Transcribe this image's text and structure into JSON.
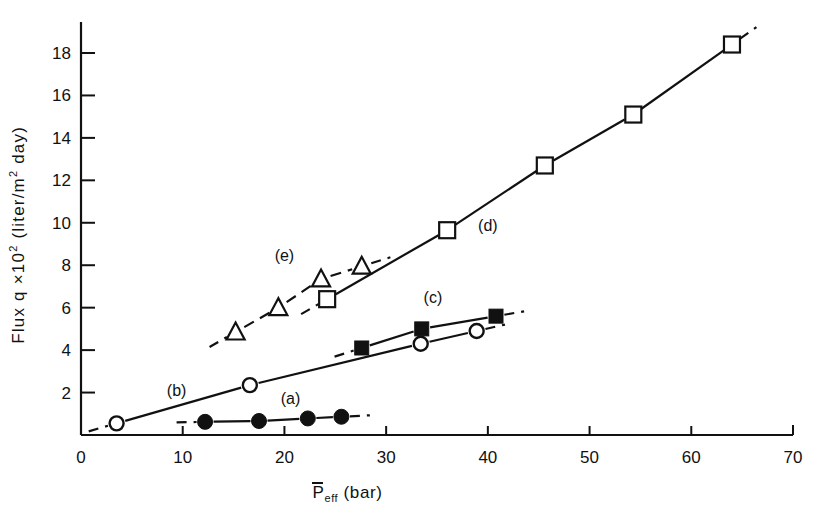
{
  "figure": {
    "background": "#ffffff",
    "ink_color": "#111111"
  },
  "chart_data": {
    "type": "scatter",
    "title": "",
    "subtitle": "",
    "xlabel": "P̄eff (bar)",
    "xlabel_parts": {
      "bar_letter": "P",
      "subscript": "eff",
      "unit": "(bar)"
    },
    "ylabel": "Flux q ×10² (liter/m² day)",
    "ylabel_parts": {
      "prefix": "Flux q ×10",
      "exponent": "2",
      "unit": "(liter/m",
      "unit_exponent": "2",
      "unit_tail": " day)"
    },
    "xlim": [
      0,
      70
    ],
    "ylim": [
      0,
      19.4
    ],
    "xticks": [
      0,
      10,
      20,
      30,
      40,
      50,
      60,
      70
    ],
    "xticklabels": [
      "0",
      "10",
      "20",
      "30",
      "40",
      "50",
      "60",
      "70"
    ],
    "yticks": [
      2,
      4,
      6,
      8,
      10,
      12,
      14,
      16,
      18
    ],
    "yticklabels": [
      "2",
      "4",
      "6",
      "8",
      "10",
      "12",
      "14",
      "16",
      "18"
    ],
    "grid": false,
    "legend_position": "inline-annotations",
    "series": [
      {
        "name": "(a)",
        "label": "(a)",
        "marker": "filled-circle",
        "line": "solid",
        "dashed_extensions": true,
        "label_x": 20.6,
        "label_y": 1.45,
        "x": [
          12.2,
          17.5,
          22.3,
          25.6
        ],
        "y": [
          0.62,
          0.66,
          0.78,
          0.86
        ]
      },
      {
        "name": "(b)",
        "label": "(b)",
        "marker": "open-circle",
        "line": "solid",
        "dashed_extensions": true,
        "label_x": 9.4,
        "label_y": 1.85,
        "x": [
          3.5,
          16.6,
          33.4,
          38.9
        ],
        "y": [
          0.55,
          2.35,
          4.3,
          4.9
        ]
      },
      {
        "name": "(c)",
        "label": "(c)",
        "marker": "filled-square",
        "line": "solid",
        "dashed_extensions": true,
        "label_x": 34.6,
        "label_y": 6.2,
        "x": [
          27.6,
          33.5,
          40.8
        ],
        "y": [
          4.1,
          5.0,
          5.6
        ]
      },
      {
        "name": "(d)",
        "label": "(d)",
        "marker": "open-square",
        "line": "solid",
        "dashed_extensions": true,
        "label_x": 40.0,
        "label_y": 9.6,
        "x": [
          24.2,
          36.0,
          45.6,
          54.3,
          64.0
        ],
        "y": [
          6.4,
          9.65,
          12.7,
          15.1,
          18.4
        ]
      },
      {
        "name": "(e)",
        "label": "(e)",
        "marker": "open-triangle",
        "line": "dashed",
        "dashed_extensions": true,
        "label_x": 20.0,
        "label_y": 8.2,
        "x": [
          15.2,
          19.4,
          23.6,
          27.6
        ],
        "y": [
          4.85,
          6.0,
          7.35,
          7.95
        ]
      }
    ]
  }
}
